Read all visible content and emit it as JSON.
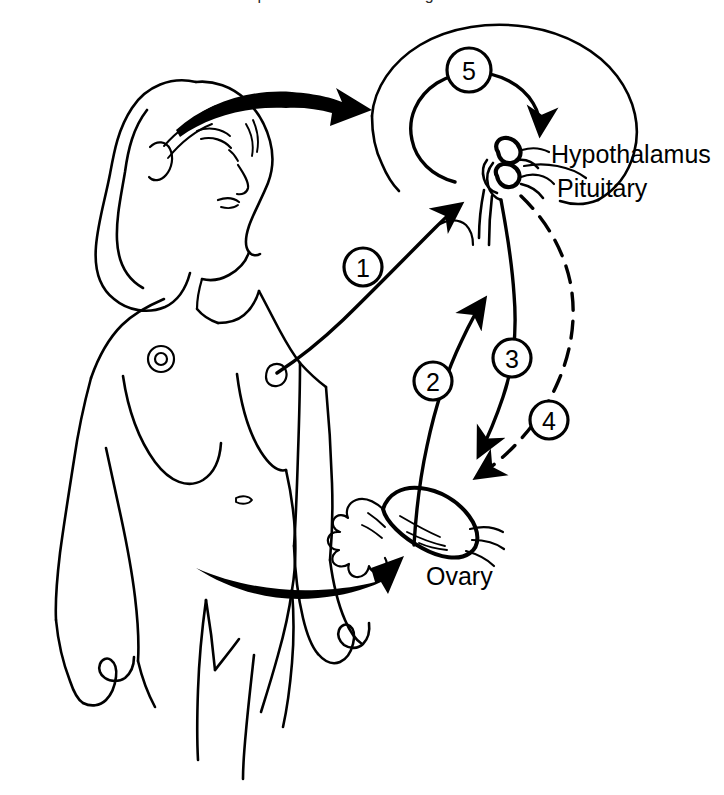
{
  "figure": {
    "type": "line-art anatomical diagram",
    "cut_off_header_text": "reproductive endocrine regulation",
    "background_color": "#ffffff",
    "ink_color": "#000000"
  },
  "labels": {
    "hypothalamus": "Hypothalamus",
    "pituitary": "Pituitary",
    "ovary": "Ovary"
  },
  "steps": [
    {
      "number": "1",
      "cx": 363,
      "cy": 267,
      "r": 19
    },
    {
      "number": "2",
      "cx": 433,
      "cy": 381,
      "r": 19
    },
    {
      "number": "3",
      "cx": 512,
      "cy": 358,
      "r": 19
    },
    {
      "number": "4",
      "cx": 549,
      "cy": 420,
      "r": 19
    },
    {
      "number": "5",
      "cx": 469,
      "cy": 70,
      "r": 22
    }
  ],
  "arrows": [
    {
      "id": "1",
      "from": "body",
      "to": "hypothalamus",
      "style": "solid"
    },
    {
      "id": "2",
      "from": "ovary",
      "to": "pituitary",
      "style": "solid"
    },
    {
      "id": "3",
      "from": "pituitary",
      "to": "ovary",
      "style": "solid"
    },
    {
      "id": "4",
      "from": "pituitary",
      "to": "ovary",
      "style": "dashed"
    },
    {
      "id": "5",
      "from": "hypothalamus",
      "to": "hypothalamus",
      "style": "solid-loop"
    }
  ],
  "pointer_arrows": [
    {
      "id": "head-pointer",
      "description": "thick black arrow from woman's head to brain diagram"
    },
    {
      "id": "pelvis-pointer",
      "description": "thick black arrow from woman's pelvis to ovary diagram"
    }
  ],
  "figure_subject": {
    "name": "female-figure",
    "description": "line drawing of a nude woman standing, head tilted, eyes closed"
  }
}
